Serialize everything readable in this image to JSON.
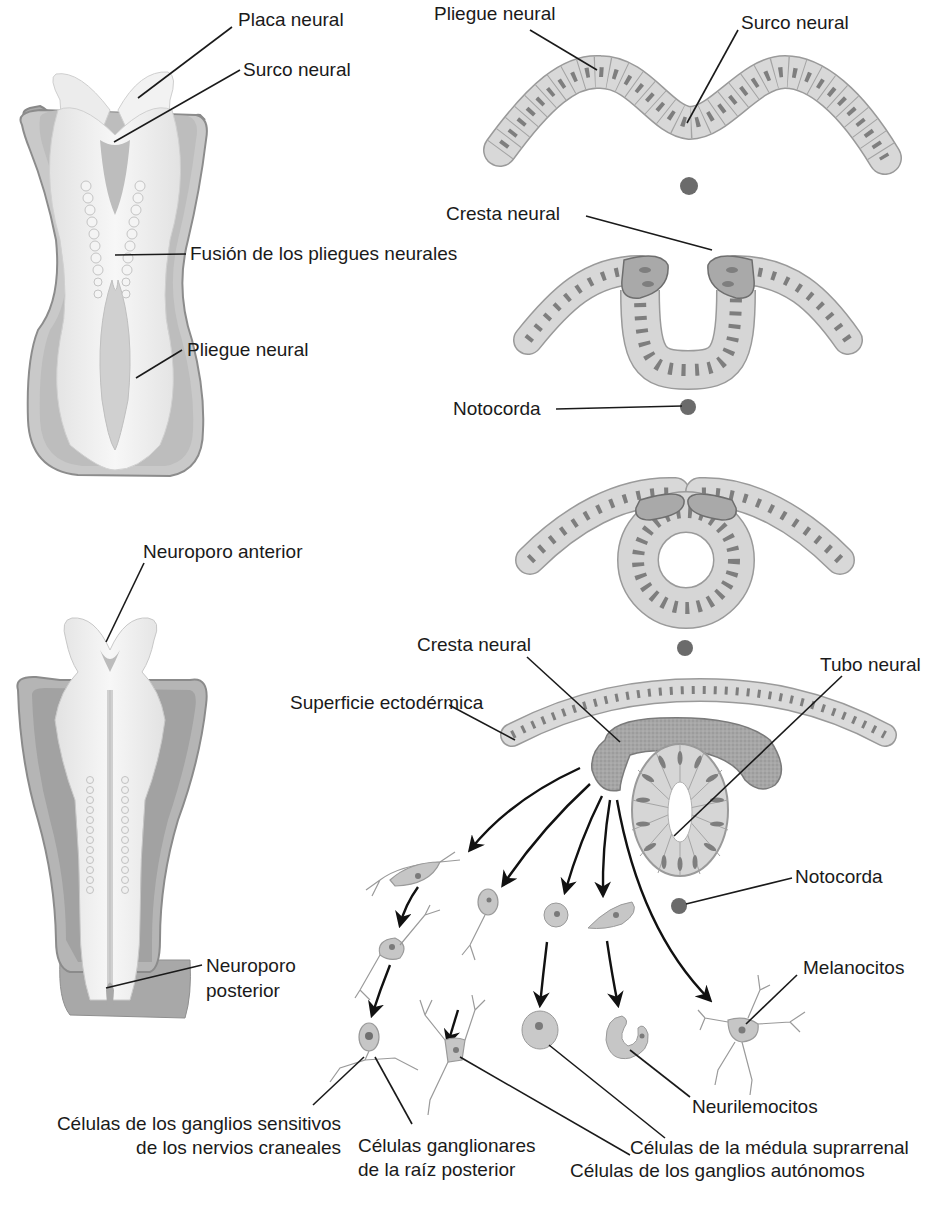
{
  "figure": {
    "colors": {
      "background": "#ffffff",
      "cell_fill": "#d6d6d6",
      "cell_stroke": "#9a9a9a",
      "nucleus": "#7d7d7d",
      "crest_fill": "#a9a9a9",
      "notochord": "#6a6a6a",
      "embryo_outer": "#a8a8a8",
      "embryo_inner": "#eeeeee",
      "leader_line": "#1a1a1a"
    },
    "embryo_top": {
      "labels": {
        "neural_plate": "Placa neural",
        "neural_groove": "Surco neural",
        "fusion": "Fusión de los pliegues neurales",
        "neural_fold": "Pliegue neural"
      }
    },
    "embryo_bottom": {
      "labels": {
        "anterior_neuropore": "Neuroporo anterior",
        "posterior_neuropore_line1": "Neuroporo",
        "posterior_neuropore_line2": "posterior"
      }
    },
    "sections": {
      "stage1": {
        "neural_fold": "Pliegue neural",
        "neural_groove": "Surco neural"
      },
      "stage2": {
        "neural_crest": "Cresta neural",
        "notochord": "Notocorda"
      },
      "stage4": {
        "neural_crest": "Cresta neural",
        "neural_tube": "Tubo neural",
        "surface_ectoderm": "Superficie ectodérmica",
        "notochord": "Notocorda"
      }
    },
    "derivatives": {
      "melanocytes": "Melanocitos",
      "neurilemmocytes": "Neurilemocitos",
      "sensory_ganglia_line1": "Células de los ganglios sensitivos",
      "sensory_ganglia_line2": "de los nervios craneales",
      "dorsal_root_line1": "Células ganglionares",
      "dorsal_root_line2": "de la raíz posterior",
      "adrenal_medulla": "Células de la médula suprarrenal",
      "autonomic_ganglia": "Células de los ganglios autónomos"
    }
  }
}
